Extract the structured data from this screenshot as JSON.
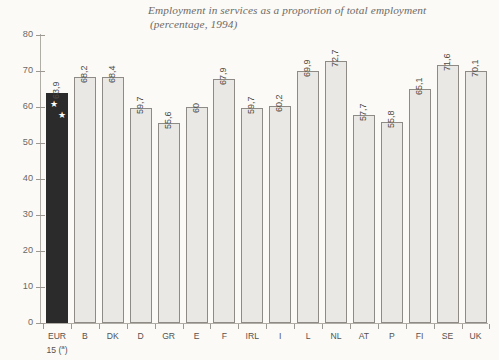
{
  "chart_data": {
    "type": "bar",
    "title": "Employment in services as a proportion of total employment",
    "subtitle": "(percentage, 1994)",
    "xlabel": "",
    "ylabel": "",
    "ylim": [
      0,
      80
    ],
    "yticks": [
      0,
      10,
      20,
      30,
      40,
      50,
      60,
      70,
      80
    ],
    "ytick_labels": [
      "0",
      "10",
      "20",
      "30",
      "40",
      "50",
      "60",
      "70",
      "80"
    ],
    "grid": false,
    "legend": "none",
    "decimal_separator": ",",
    "categories": [
      "EUR 15 (a)",
      "B",
      "DK",
      "D",
      "GR",
      "E",
      "F",
      "IRL",
      "I",
      "L",
      "NL",
      "AT",
      "P",
      "FI",
      "SE",
      "UK"
    ],
    "category_labels": [
      {
        "line1": "EUR",
        "line2": "15 (a)",
        "superscript": "a"
      },
      {
        "line1": "B",
        "line2": ""
      },
      {
        "line1": "DK",
        "line2": ""
      },
      {
        "line1": "D",
        "line2": ""
      },
      {
        "line1": "GR",
        "line2": ""
      },
      {
        "line1": "E",
        "line2": ""
      },
      {
        "line1": "F",
        "line2": ""
      },
      {
        "line1": "IRL",
        "line2": ""
      },
      {
        "line1": "I",
        "line2": ""
      },
      {
        "line1": "L",
        "line2": ""
      },
      {
        "line1": "NL",
        "line2": ""
      },
      {
        "line1": "AT",
        "line2": ""
      },
      {
        "line1": "P",
        "line2": ""
      },
      {
        "line1": "FI",
        "line2": ""
      },
      {
        "line1": "SE",
        "line2": ""
      },
      {
        "line1": "UK",
        "line2": ""
      }
    ],
    "values": [
      63.9,
      68.2,
      68.4,
      59.7,
      55.6,
      60,
      67.9,
      59.7,
      60.2,
      69.9,
      72.7,
      57.7,
      55.8,
      65.1,
      71.6,
      70.1
    ],
    "value_labels": [
      "63,9",
      "68,2",
      "68,4",
      "59,7",
      "55,6",
      "60",
      "67,9",
      "59,7",
      "60,2",
      "69,9",
      "72,7",
      "57,7",
      "55,8",
      "65,1",
      "71,6",
      "70,1"
    ],
    "highlight_index": 0,
    "colors": {
      "background": "#fbfaf7",
      "bar_fill": "#e9e8e4",
      "bar_stroke": "#8e8b86",
      "highlight_fill": "#2b2b2b",
      "axis": "#b0aca6",
      "text": "#55524e",
      "title_text": "#6e6b66"
    },
    "highlight_marker": "white-stars"
  }
}
